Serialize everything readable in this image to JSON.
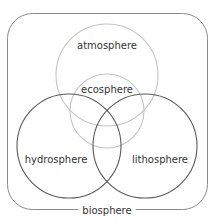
{
  "diagram": {
    "type": "venn",
    "container": {
      "label": "biosphere",
      "x": 7,
      "y": 13,
      "width": 200,
      "height": 196,
      "corner_radius": 25,
      "stroke": "#8a8a8a"
    },
    "circles": [
      {
        "id": "atmosphere",
        "label": "atmosphere",
        "cx": 107,
        "cy": 75,
        "r": 51,
        "stroke": "#c4c4c4",
        "label_x": 107,
        "label_y": 49
      },
      {
        "id": "ecosphere",
        "label": "ecosphere",
        "cx": 107,
        "cy": 111,
        "r": 37,
        "stroke": "#c4c4c4",
        "label_x": 107,
        "label_y": 93
      },
      {
        "id": "hydrosphere",
        "label": "hydrosphere",
        "cx": 69,
        "cy": 146,
        "r": 52,
        "stroke": "#5a5a5a",
        "label_x": 56,
        "label_y": 163
      },
      {
        "id": "lithosphere",
        "label": "lithosphere",
        "cx": 145,
        "cy": 146,
        "r": 52,
        "stroke": "#5a5a5a",
        "label_x": 160,
        "label_y": 163
      }
    ]
  }
}
